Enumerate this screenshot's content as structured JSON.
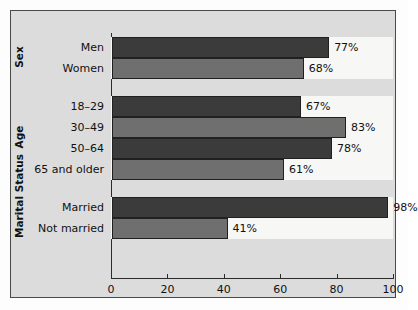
{
  "chart_data": {
    "type": "bar",
    "orientation": "horizontal",
    "title": "",
    "xlabel": "",
    "ylabel": "",
    "xlim": [
      0,
      100
    ],
    "xticks": [
      0,
      20,
      40,
      60,
      80,
      100
    ],
    "xtick_labels": [
      "0",
      "20",
      "40",
      "60",
      "80",
      "100"
    ],
    "grid": false,
    "legend": null,
    "value_suffix": "%",
    "colors": {
      "dark_bar": "#3b3b3b",
      "light_bar": "#6f6f6f",
      "panel_background": "#dcdcdc",
      "band_background": "#f7f7f5",
      "axis": "#2b2b2b",
      "text": "#111111"
    },
    "groups": [
      {
        "name": "Sex",
        "categories": [
          "Men",
          "Women"
        ],
        "values": [
          77,
          68
        ],
        "value_labels": [
          "77%",
          "68%"
        ],
        "shades": [
          "dark",
          "light"
        ]
      },
      {
        "name": "Age",
        "categories": [
          "18–29",
          "30–49",
          "50–64",
          "65 and older"
        ],
        "values": [
          67,
          83,
          78,
          61
        ],
        "value_labels": [
          "67%",
          "83%",
          "78%",
          "61%"
        ],
        "shades": [
          "dark",
          "light",
          "dark",
          "light"
        ]
      },
      {
        "name": "Marital Status",
        "categories": [
          "Married",
          "Not married"
        ],
        "values": [
          98,
          41
        ],
        "value_labels": [
          "98%",
          "41%"
        ],
        "shades": [
          "dark",
          "light"
        ]
      }
    ]
  }
}
